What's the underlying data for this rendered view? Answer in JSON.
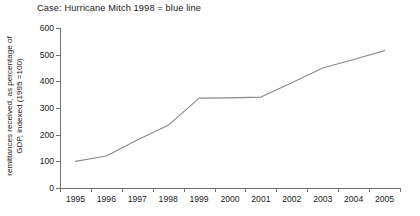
{
  "chart_data": {
    "type": "line",
    "title": "Case: Hurricane Mitch 1998 = blue line",
    "xlabel": "",
    "ylabel": "remittances received, as percentage of GDP, indexed (1995 =100)",
    "ylabel_line1": "remittances received, as percentage of",
    "ylabel_line2": "GDP, indexed (1995 =100)",
    "categories": [
      "1995",
      "1996",
      "1997",
      "1998",
      "1999",
      "2000",
      "2001",
      "2002",
      "2003",
      "2004",
      "2005"
    ],
    "x": [
      1995,
      1996,
      1997,
      1998,
      1999,
      2000,
      2001,
      2002,
      2003,
      2004,
      2005
    ],
    "series": [
      {
        "name": "Hurricane Mitch 1998",
        "color": "#8a8a8a",
        "values": [
          100,
          120,
          180,
          235,
          337,
          338,
          341,
          395,
          450,
          482,
          515
        ]
      }
    ],
    "ylim": [
      0,
      600
    ],
    "yticks": [
      0,
      100,
      200,
      300,
      400,
      500,
      600
    ],
    "ytick_labels": [
      "0",
      "100",
      "200",
      "300",
      "400",
      "500",
      "600"
    ],
    "xlim": [
      1995,
      2005
    ],
    "grid": false,
    "legend": "none",
    "line_color": "#8a8a8a",
    "axis_color": "#6f6f6f",
    "background": "#ffffff"
  }
}
